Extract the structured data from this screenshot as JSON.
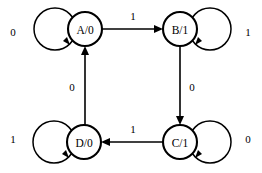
{
  "diagram": {
    "type": "finite-state-machine",
    "background_color": "#ffffff",
    "stroke_color": "#000000",
    "states": [
      {
        "id": "A",
        "label": "A/0",
        "state_name": "A",
        "output": "0",
        "cx": 85,
        "cy": 29,
        "r": 17
      },
      {
        "id": "B",
        "label": "B/1",
        "state_name": "B",
        "output": "1",
        "cx": 180,
        "cy": 29,
        "r": 17
      },
      {
        "id": "C",
        "label": "C/1",
        "state_name": "C",
        "output": "1",
        "cx": 180,
        "cy": 142,
        "r": 17
      },
      {
        "id": "D",
        "label": "D/0",
        "state_name": "D",
        "output": "0",
        "cx": 84,
        "cy": 142,
        "r": 17
      }
    ],
    "self_loops": [
      {
        "state": "A",
        "label": "0",
        "side": "left",
        "label_x": 13,
        "label_y": 32
      },
      {
        "state": "B",
        "label": "1",
        "side": "right",
        "label_x": 248,
        "label_y": 32
      },
      {
        "state": "C",
        "label": "0",
        "side": "right",
        "label_x": 248,
        "label_y": 139
      },
      {
        "state": "D",
        "label": "1",
        "side": "left",
        "label_x": 13,
        "label_y": 139
      }
    ],
    "transitions": [
      {
        "from": "A",
        "to": "B",
        "label": "1",
        "direction": "right",
        "label_x": 133,
        "label_y": 16
      },
      {
        "from": "B",
        "to": "C",
        "label": "0",
        "direction": "down",
        "label_x": 192,
        "label_y": 87
      },
      {
        "from": "C",
        "to": "D",
        "label": "1",
        "direction": "left",
        "label_x": 133,
        "label_y": 129
      },
      {
        "from": "D",
        "to": "A",
        "label": "0",
        "direction": "up",
        "label_x": 72,
        "label_y": 87
      }
    ]
  }
}
